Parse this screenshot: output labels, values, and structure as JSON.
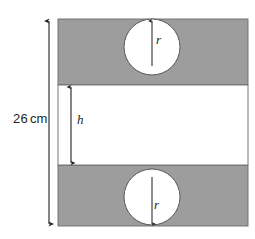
{
  "figure": {
    "colors": {
      "shaded_panel": "#9d9d9d",
      "panel_outline": "#6b6b6b",
      "circle_fill": "#ffffff",
      "circle_outline": "#58595b",
      "ink": "#231f20",
      "background": "#ffffff"
    },
    "geometry": {
      "panel_left": 58,
      "panel_right": 248,
      "panel_top": 19,
      "panel_bottom": 226,
      "band_top": 85,
      "band_bottom": 165,
      "circle_cx": 152,
      "circle_r": 28,
      "circle_top_cy": 47,
      "circle_bottom_cy": 197,
      "total_dim_x": 49,
      "h_dim_x": 71
    }
  },
  "labels": {
    "total_height": {
      "value": "26",
      "unit": "cm"
    },
    "band_height": "h",
    "radius_top": "r",
    "radius_bottom": "r"
  }
}
